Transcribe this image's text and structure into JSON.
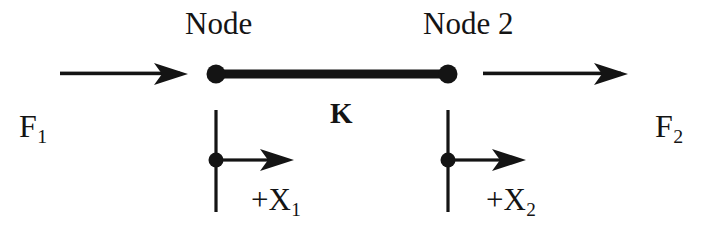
{
  "diagram": {
    "background_color": "#ffffff",
    "ink_color": "#141414",
    "labels": {
      "node_1": "Node",
      "node_2": "Node 2",
      "stiffness": "K",
      "force_1_symbol": "F",
      "force_1_subscript": "1",
      "force_2_symbol": "F",
      "force_2_subscript": "2",
      "displacement_1_symbol": "+X",
      "displacement_1_subscript": "1",
      "displacement_2_symbol": "+X",
      "displacement_2_subscript": "2"
    },
    "geometry": {
      "node_1_x": 216,
      "node_2_x": 448,
      "element_y": 74,
      "node_radius": 9.5,
      "element_thickness": 9,
      "force_arrow_1_start_x": 60,
      "force_arrow_1_end_x": 188,
      "force_arrow_2_start_x": 483,
      "force_arrow_2_end_x": 628,
      "force_arrow_y": 74,
      "dof_dot_y": 160,
      "dof_dot_radius": 7.5,
      "dof_line_top_y": 110,
      "dof_line_bottom_y": 212,
      "dof_arrow_1_end_x": 294,
      "dof_arrow_2_end_x": 526
    }
  }
}
